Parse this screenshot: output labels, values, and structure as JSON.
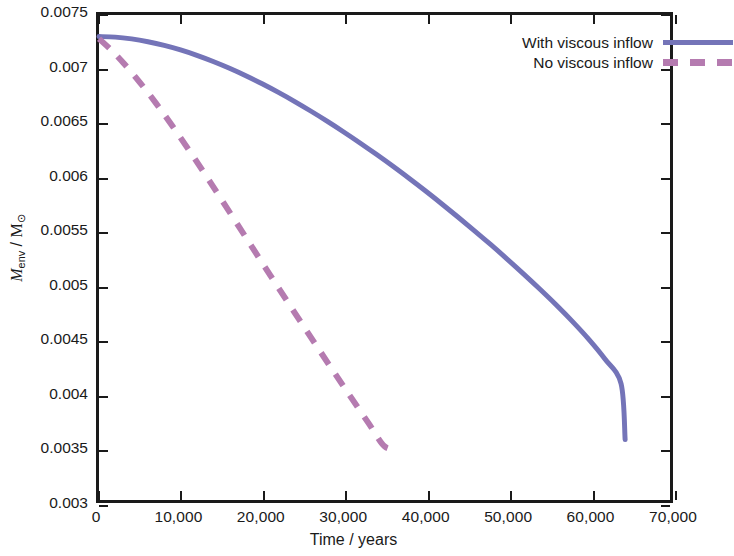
{
  "chart_data": {
    "type": "line",
    "title": "",
    "xlabel": "Time / years",
    "ylabel": "M_env / M_sun",
    "ylabel_parts": {
      "symbol": "M",
      "subscript": "env",
      "separator": " / ",
      "unit": "M",
      "unit_subscript": "⊙"
    },
    "xlim": [
      0,
      70000
    ],
    "ylim": [
      0.003,
      0.0075
    ],
    "xticks": [
      0,
      10000,
      20000,
      30000,
      40000,
      50000,
      60000,
      70000
    ],
    "xticklabels": [
      "0",
      "10,000",
      "20,000",
      "30,000",
      "40,000",
      "50,000",
      "60,000",
      "70,000"
    ],
    "yticks": [
      0.003,
      0.0035,
      0.004,
      0.0045,
      0.005,
      0.0055,
      0.006,
      0.0065,
      0.007,
      0.0075
    ],
    "yticklabels": [
      "0.003",
      "0.0035",
      "0.004",
      "0.0045",
      "0.005",
      "0.0055",
      "0.006",
      "0.0065",
      "0.007",
      "0.0075"
    ],
    "grid": false,
    "legend_position": "top-right-inside",
    "series": [
      {
        "name": "With viscous inflow",
        "color": "#7474b8",
        "style": "solid",
        "linewidth": 5,
        "x": [
          0,
          2000,
          4000,
          6000,
          8000,
          10000,
          12000,
          14000,
          16000,
          18000,
          20000,
          22000,
          24000,
          26000,
          28000,
          30000,
          32000,
          34000,
          36000,
          38000,
          40000,
          42000,
          44000,
          46000,
          48000,
          50000,
          52000,
          54000,
          56000,
          58000,
          60000,
          62000,
          64000,
          64500
        ],
        "y": [
          0.0073,
          0.007295,
          0.007278,
          0.007252,
          0.007218,
          0.007176,
          0.007126,
          0.007069,
          0.007006,
          0.006937,
          0.006862,
          0.006782,
          0.006697,
          0.006607,
          0.006513,
          0.006415,
          0.006313,
          0.006207,
          0.006098,
          0.005985,
          0.005869,
          0.005749,
          0.005626,
          0.0055,
          0.005371,
          0.005238,
          0.005101,
          0.00496,
          0.004814,
          0.00466,
          0.004495,
          0.00431,
          0.00408,
          0.00356
        ]
      },
      {
        "name": "No viscous inflow",
        "color": "#b57bb0",
        "style": "dashed",
        "linewidth": 6,
        "dash_pattern": "14 12",
        "x": [
          0,
          1500,
          3000,
          5000,
          7000,
          9000,
          11000,
          13000,
          15000,
          18000,
          21000,
          24000,
          27000,
          30000,
          33000,
          35000,
          36500
        ],
        "y": [
          0.00728,
          0.007175,
          0.007055,
          0.006875,
          0.00668,
          0.00647,
          0.00625,
          0.006022,
          0.00579,
          0.005437,
          0.005085,
          0.004737,
          0.004392,
          0.004052,
          0.003718,
          0.003498,
          0.00348
        ]
      }
    ]
  },
  "legend": {
    "items": [
      {
        "label": "With viscous inflow",
        "style": "solid",
        "color": "#7474b8"
      },
      {
        "label": "No viscous inflow",
        "style": "dashed",
        "color": "#b57bb0"
      }
    ]
  },
  "axes": {
    "frame_color": "#1a1a1a",
    "tick_direction": "in"
  }
}
